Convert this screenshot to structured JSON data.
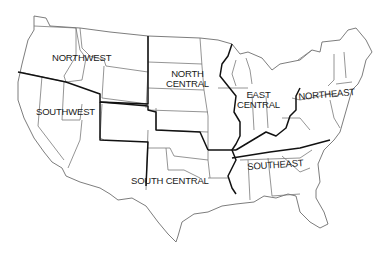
{
  "map": {
    "title": "United States regions",
    "colors": {
      "background": "#ffffff",
      "state_lines": "#7a7a7a",
      "region_lines": "#111111",
      "text": "#1a1a1a"
    },
    "regions": [
      {
        "id": "northwest",
        "line1": "NORTHWEST",
        "line2": ""
      },
      {
        "id": "southwest",
        "line1": "SOUTHWEST",
        "line2": ""
      },
      {
        "id": "north-central",
        "line1": "NORTH",
        "line2": "CENTRAL"
      },
      {
        "id": "south-central",
        "line1": "SOUTH CENTRAL",
        "line2": ""
      },
      {
        "id": "east-central",
        "line1": "EAST",
        "line2": "CENTRAL"
      },
      {
        "id": "northeast",
        "line1": "NORTHEAST",
        "line2": ""
      },
      {
        "id": "southeast",
        "line1": "SOUTHEAST",
        "line2": ""
      }
    ]
  }
}
